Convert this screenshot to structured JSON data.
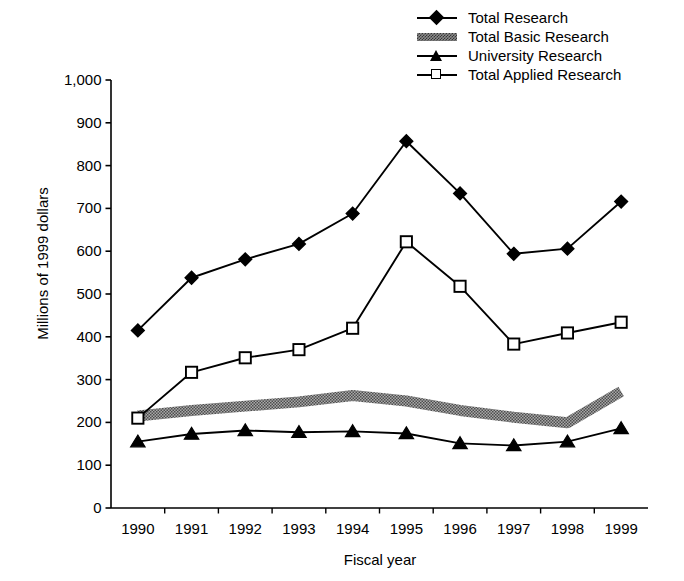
{
  "chart_data": {
    "type": "line",
    "title": "",
    "xlabel": "Fiscal year",
    "ylabel": "Millions of 1999 dollars",
    "categories": [
      "1990",
      "1991",
      "1992",
      "1993",
      "1994",
      "1995",
      "1996",
      "1997",
      "1998",
      "1999"
    ],
    "x": [
      1990,
      1991,
      1992,
      1993,
      1994,
      1995,
      1996,
      1997,
      1998,
      1999
    ],
    "ylim": [
      0,
      1000
    ],
    "yticks": [
      0,
      100,
      200,
      300,
      400,
      500,
      600,
      700,
      800,
      900,
      1000
    ],
    "ytick_labels": [
      "0",
      "100",
      "200",
      "300",
      "400",
      "500",
      "600",
      "700",
      "800",
      "900",
      "1,000"
    ],
    "grid": false,
    "legend_position": "top-right",
    "series": [
      {
        "name": "Total Research",
        "marker": "filled-diamond",
        "color": "#000000",
        "values": [
          415,
          538,
          581,
          617,
          688,
          857,
          735,
          594,
          606,
          716
        ]
      },
      {
        "name": "Total Basic Research",
        "marker": "gray-band",
        "color": "#8a8a8a",
        "values": [
          215,
          228,
          238,
          248,
          263,
          250,
          228,
          212,
          199,
          272
        ]
      },
      {
        "name": "University Research",
        "marker": "filled-triangle",
        "color": "#000000",
        "values": [
          155,
          173,
          181,
          177,
          179,
          174,
          151,
          146,
          155,
          186
        ]
      },
      {
        "name": "Total Applied Research",
        "marker": "open-square",
        "color": "#000000",
        "values": [
          210,
          317,
          351,
          370,
          420,
          622,
          518,
          383,
          409,
          434
        ]
      }
    ]
  },
  "legend": {
    "items": [
      {
        "label": "Total Research",
        "key": "filled-diamond-key"
      },
      {
        "label": "Total Basic Research",
        "key": "gray-band-key"
      },
      {
        "label": "University Research",
        "key": "filled-triangle-key"
      },
      {
        "label": "Total Applied Research",
        "key": "open-square-key"
      }
    ]
  },
  "axes": {
    "y_title": "Millions of 1999 dollars",
    "x_title": "Fiscal year"
  }
}
